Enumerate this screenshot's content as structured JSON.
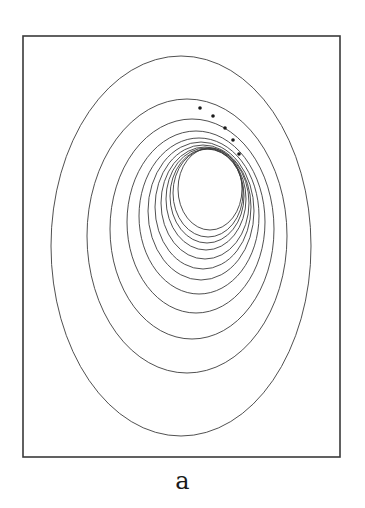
{
  "figure": {
    "caption": "a",
    "frame": {
      "x": 23,
      "y": 36,
      "width": 317,
      "height": 421
    },
    "colors": {
      "line": "#3c3c3c",
      "frame": "#3a3a3a",
      "dot": "#1a1a1a",
      "background": "#ffffff"
    },
    "contours": [
      {
        "cx": 181,
        "cy": 246,
        "rx": 130,
        "ry": 190
      },
      {
        "cx": 187,
        "cy": 236,
        "rx": 100,
        "ry": 137
      },
      {
        "cx": 192,
        "cy": 229,
        "rx": 82,
        "ry": 110
      },
      {
        "cx": 196,
        "cy": 222,
        "rx": 69,
        "ry": 91
      },
      {
        "cx": 199,
        "cy": 216,
        "rx": 60,
        "ry": 78
      },
      {
        "cx": 201,
        "cy": 211,
        "rx": 53,
        "ry": 69
      },
      {
        "cx": 203,
        "cy": 207,
        "rx": 48,
        "ry": 62
      },
      {
        "cx": 205,
        "cy": 203,
        "rx": 44,
        "ry": 56
      },
      {
        "cx": 206,
        "cy": 199,
        "rx": 40,
        "ry": 51
      },
      {
        "cx": 207,
        "cy": 196,
        "rx": 37,
        "ry": 47
      },
      {
        "cx": 208,
        "cy": 193,
        "rx": 35,
        "ry": 44
      },
      {
        "cx": 210,
        "cy": 189,
        "rx": 32,
        "ry": 41
      }
    ],
    "dots": [
      {
        "x": 200,
        "y": 108
      },
      {
        "x": 213,
        "y": 116
      },
      {
        "x": 225,
        "y": 128
      },
      {
        "x": 233,
        "y": 140
      },
      {
        "x": 239,
        "y": 154
      }
    ]
  }
}
